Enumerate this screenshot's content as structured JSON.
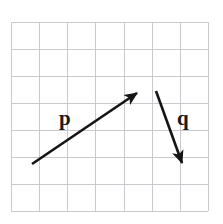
{
  "figure": {
    "name": "vector-grid-diagram",
    "width": 223,
    "height": 224,
    "background_color": "#ffffff"
  },
  "grid": {
    "name": "square-grid",
    "columns": 7,
    "rows": 7,
    "cell_size": 28.2,
    "left": 11,
    "top": 22,
    "right": 208,
    "bottom": 211,
    "line_color": "#c9c9cf",
    "line_width": 1
  },
  "vectors": [
    {
      "label": "p",
      "name": "vector-p",
      "color": "#141414",
      "line_width": 2.6,
      "start": {
        "x": 32,
        "y": 164
      },
      "end": {
        "x": 137,
        "y": 93
      },
      "arrowhead": "filled-triangle",
      "label_position": {
        "x": 59,
        "y": 108
      }
    },
    {
      "label": "q",
      "name": "vector-q",
      "color": "#141414",
      "line_width": 2.6,
      "start": {
        "x": 156,
        "y": 91
      },
      "end": {
        "x": 182,
        "y": 163
      },
      "arrowhead": "filled-triangle",
      "label_position": {
        "x": 177,
        "y": 108
      }
    }
  ]
}
